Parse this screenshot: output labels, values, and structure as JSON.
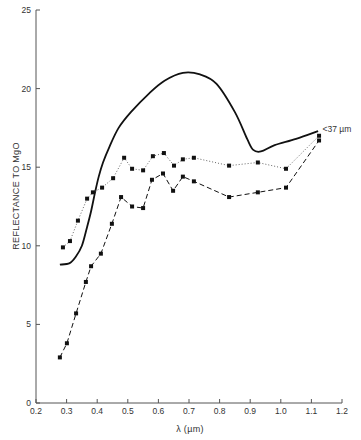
{
  "chart_data": {
    "type": "line",
    "title": "",
    "xlabel": "λ (µm)",
    "ylabel": "REFLECTANCE TO MgO",
    "xlim": [
      0.2,
      1.2
    ],
    "ylim": [
      0,
      25
    ],
    "x_ticks": [
      "0.2",
      "0.3",
      "0.4",
      "0.5",
      "0.6",
      "0.7",
      "0.8",
      "0.9",
      "1.0",
      "1.1",
      "1.2"
    ],
    "y_ticks": [
      "0",
      "5",
      "10",
      "15",
      "20",
      "25"
    ],
    "grid": false,
    "annotations": [
      {
        "text": "<37 µm",
        "x": 1.13,
        "y": 17.4
      }
    ],
    "series": [
      {
        "name": "<37 µm (solid)",
        "style": "solid",
        "markers": false,
        "x": [
          0.278,
          0.31,
          0.33,
          0.35,
          0.367,
          0.38,
          0.393,
          0.405,
          0.419,
          0.44,
          0.47,
          0.51,
          0.57,
          0.62,
          0.68,
          0.736,
          0.79,
          0.85,
          0.89,
          0.91,
          0.935,
          0.98,
          1.05,
          1.122
        ],
        "values": [
          8.8,
          8.9,
          9.3,
          10.0,
          11.2,
          12.2,
          13.4,
          14.4,
          15.3,
          16.3,
          17.5,
          18.5,
          19.7,
          20.5,
          21.0,
          20.9,
          20.3,
          18.5,
          16.8,
          16.1,
          16.0,
          16.4,
          16.8,
          17.3
        ]
      },
      {
        "name": "dotted",
        "style": "dotted",
        "markers": true,
        "x": [
          0.288,
          0.311,
          0.337,
          0.367,
          0.386,
          0.416,
          0.452,
          0.488,
          0.514,
          0.55,
          0.582,
          0.618,
          0.651,
          0.68,
          0.716,
          0.831,
          0.925,
          1.017,
          1.125
        ],
        "values": [
          9.9,
          10.3,
          11.6,
          13.0,
          13.4,
          13.7,
          14.3,
          15.6,
          14.9,
          14.8,
          15.7,
          15.9,
          15.1,
          15.5,
          15.6,
          15.1,
          15.3,
          14.9,
          17.0
        ]
      },
      {
        "name": "dashed",
        "style": "dashed",
        "markers": true,
        "x": [
          0.278,
          0.301,
          0.331,
          0.363,
          0.38,
          0.412,
          0.448,
          0.478,
          0.514,
          0.55,
          0.579,
          0.615,
          0.648,
          0.68,
          0.716,
          0.831,
          0.925,
          1.017,
          1.125
        ],
        "values": [
          2.9,
          3.8,
          5.7,
          7.7,
          8.7,
          9.5,
          11.4,
          13.1,
          12.5,
          12.4,
          14.2,
          14.6,
          13.5,
          14.4,
          14.1,
          13.1,
          13.4,
          13.7,
          16.7
        ]
      }
    ]
  }
}
